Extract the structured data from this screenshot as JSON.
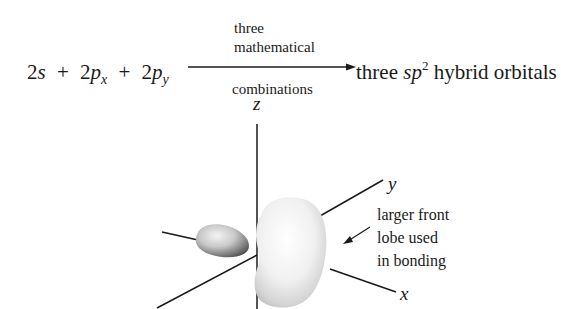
{
  "equation": {
    "lhs": {
      "term1_coef": "2",
      "term1_var": "s",
      "plus1": "+",
      "term2_coef": "2",
      "term2_var": "p",
      "term2_sub": "x",
      "plus2": "+",
      "term3_coef": "2",
      "term3_var": "p",
      "term3_sub": "y"
    },
    "arrow_above_line1": "three",
    "arrow_above_line2": "mathematical",
    "arrow_below": "combinations",
    "rhs": {
      "word1": "three",
      "sp": "sp",
      "sup": "2",
      "rest": "hybrid orbitals"
    }
  },
  "diagram": {
    "axes": {
      "z": "z",
      "y": "y",
      "x": "x"
    },
    "annotation": {
      "line1": "larger front",
      "line2": "lobe used",
      "line3": "in bonding"
    },
    "lobes": [
      {
        "name": "small-back-lobe",
        "shade": "dark"
      },
      {
        "name": "large-front-lobe",
        "shade": "light"
      }
    ]
  }
}
